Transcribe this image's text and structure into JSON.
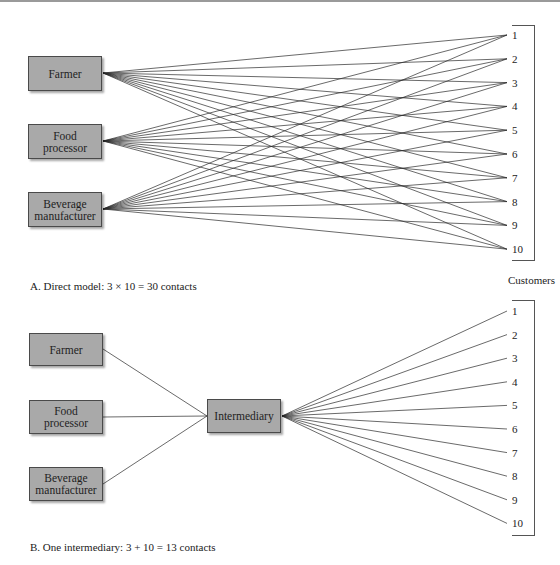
{
  "panel_a": {
    "producers": [
      {
        "label": "Farmer",
        "lines": [
          "Farmer"
        ]
      },
      {
        "label": "Food processor",
        "lines": [
          "Food",
          "processor"
        ]
      },
      {
        "label": "Beverage manufacturer",
        "lines": [
          "Beverage",
          "manufacturer"
        ]
      }
    ],
    "customers": [
      "1",
      "2",
      "3",
      "4",
      "5",
      "6",
      "7",
      "8",
      "9",
      "10"
    ],
    "customers_label": "Customers",
    "caption": "A. Direct model: 3 × 10 = 30 contacts"
  },
  "panel_b": {
    "producers": [
      {
        "label": "Farmer",
        "lines": [
          "Farmer"
        ]
      },
      {
        "label": "Food processor",
        "lines": [
          "Food",
          "processor"
        ]
      },
      {
        "label": "Beverage manufacturer",
        "lines": [
          "Beverage",
          "manufacturer"
        ]
      }
    ],
    "intermediary": "Intermediary",
    "customers": [
      "1",
      "2",
      "3",
      "4",
      "5",
      "6",
      "7",
      "8",
      "9",
      "10"
    ],
    "caption": "B. One intermediary: 3 + 10 = 13 contacts"
  },
  "colors": {
    "box_fill": "#a9a9a9",
    "box_border": "#4a4a4a",
    "line": "#2a2a2a"
  }
}
